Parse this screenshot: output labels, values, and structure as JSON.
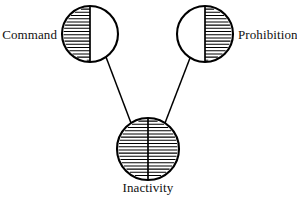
{
  "diagram": {
    "type": "node-link-diagram",
    "title": "",
    "canvas": {
      "width": 297,
      "height": 197,
      "background": "#ffffff"
    },
    "stroke_color": "#000000",
    "fill_color": "#ffffff",
    "nodes": [
      {
        "id": "command",
        "label": "Command",
        "shape": "circle",
        "cx": 90,
        "cy": 34,
        "r": 28,
        "fill_pattern": "horizontal-hatch",
        "filled_half": "left",
        "divider": "vertical",
        "label_position": "left",
        "label_x": 57,
        "label_y": 39
      },
      {
        "id": "prohibition",
        "label": "Prohibition",
        "shape": "circle",
        "cx": 205,
        "cy": 34,
        "r": 28,
        "fill_pattern": "horizontal-hatch",
        "filled_half": "right",
        "divider": "vertical",
        "label_position": "right",
        "label_x": 238,
        "label_y": 39
      },
      {
        "id": "inactivity",
        "label": "Inactivity",
        "shape": "circle",
        "cx": 148,
        "cy": 149,
        "r": 31,
        "fill_pattern": "horizontal-hatch",
        "filled_half": "full",
        "divider": "vertical",
        "label_position": "below",
        "label_x": 148,
        "label_y": 192
      }
    ],
    "edges": [
      {
        "id": "edge-command-inactivity",
        "from": "command",
        "to": "inactivity",
        "x1": 106,
        "y1": 57,
        "x2": 131,
        "y2": 123
      },
      {
        "id": "edge-prohibition-inactivity",
        "from": "prohibition",
        "to": "inactivity",
        "x1": 190,
        "y1": 58,
        "x2": 165,
        "y2": 123
      }
    ],
    "hatch": {
      "spacing": 3.2,
      "stroke_width": 1.05
    }
  }
}
